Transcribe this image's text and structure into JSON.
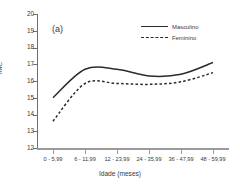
{
  "chart_data": {
    "type": "line",
    "title": "",
    "panel_label": "(a)",
    "xlabel": "Idade (meses)",
    "ylabel": "IMC",
    "categories": [
      "0 - 5,99",
      "6 - 11,99",
      "12 - 23,99",
      "24 - 35,99",
      "36 - 47,99",
      "48 - 59,99"
    ],
    "ylim": [
      12,
      20
    ],
    "yticks": [
      12,
      13,
      14,
      15,
      16,
      17,
      18,
      19,
      20
    ],
    "ytick_labels": [
      "12",
      "13",
      "14",
      "15",
      "16",
      "17",
      "18",
      "19",
      "20"
    ],
    "grid": false,
    "legend_position": "top-right",
    "series": [
      {
        "name": "Masculino",
        "style": "solid",
        "color": "#2b2b2b",
        "values": [
          15.0,
          16.7,
          16.7,
          16.3,
          16.4,
          17.1
        ]
      },
      {
        "name": "Feminino",
        "style": "dashed",
        "color": "#2b2b2b",
        "values": [
          13.6,
          15.85,
          15.85,
          15.8,
          15.95,
          16.5
        ]
      }
    ]
  }
}
